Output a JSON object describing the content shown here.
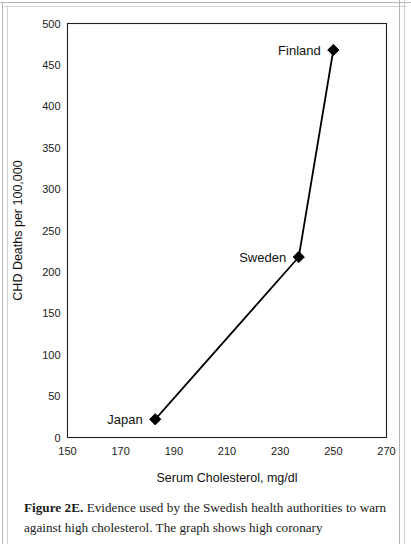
{
  "figure": {
    "caption_label": "Figure 2E.",
    "caption_text": "Evidence used by the Swedish health authorities to warn against high cholesterol. The graph shows high coronary"
  },
  "chart_data": {
    "type": "line",
    "title": "",
    "xlabel": "Serum Cholesterol, mg/dl",
    "ylabel": "CHD Deaths per 100,000",
    "xlim": [
      150,
      270
    ],
    "ylim": [
      0,
      500
    ],
    "xticks": [
      150,
      170,
      190,
      210,
      230,
      250,
      270
    ],
    "yticks": [
      0,
      50,
      100,
      150,
      200,
      250,
      300,
      350,
      400,
      450,
      500
    ],
    "grid": false,
    "legend": "none",
    "marker": "diamond",
    "marker_color": "#000000",
    "line_color": "#000000",
    "points": [
      {
        "label": "Japan",
        "x": 183,
        "y": 22,
        "label_side": "left"
      },
      {
        "label": "Sweden",
        "x": 237,
        "y": 218,
        "label_side": "left"
      },
      {
        "label": "Finland",
        "x": 250,
        "y": 468,
        "label_side": "left"
      }
    ]
  }
}
